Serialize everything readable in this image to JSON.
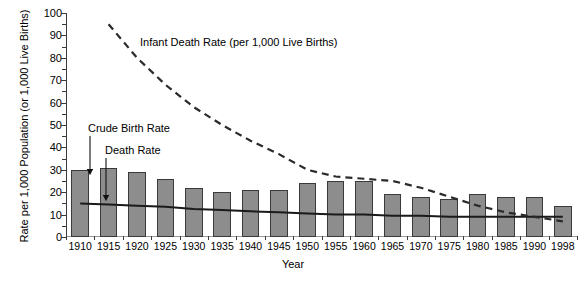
{
  "chart_data": {
    "type": "bar",
    "title": "",
    "xlabel": "Year",
    "ylabel": "Rate per 1,000 Population (or 1,000 Live Births)",
    "ylim": [
      0,
      100
    ],
    "ytick_step": 10,
    "yticks": [
      0,
      10,
      20,
      30,
      40,
      50,
      60,
      70,
      80,
      90,
      100
    ],
    "minor_tick_step": 5,
    "grid": false,
    "legend_position": "none",
    "categories": [
      "1910",
      "1915",
      "1920",
      "1925",
      "1930",
      "1935",
      "1940",
      "1945",
      "1950",
      "1955",
      "1960",
      "1965",
      "1970",
      "1975",
      "1980",
      "1985",
      "1990",
      "1998"
    ],
    "series": [
      {
        "name": "Crude Birth Rate",
        "render": "bar",
        "color": "#8d8d8d",
        "edge_color": "#3a3a3a",
        "values": [
          30,
          31,
          29,
          26,
          22,
          20,
          21,
          21,
          24,
          25,
          25,
          19,
          18,
          17,
          19,
          18,
          18,
          14
        ]
      },
      {
        "name": "Death Rate",
        "render": "solid-line",
        "color": "#1a1a1a",
        "values": [
          15,
          14.5,
          14,
          13.5,
          12.5,
          12,
          11.5,
          11,
          10.5,
          10,
          10,
          9.5,
          9.5,
          9,
          9,
          9,
          9,
          9
        ]
      },
      {
        "name": "Infant Death Rate (per 1,000 Live Births)",
        "render": "dashed-line",
        "color": "#2a2a2a",
        "start_category": "1915",
        "values": [
          null,
          95,
          80,
          68,
          58,
          50,
          43,
          37,
          30,
          27,
          26,
          25,
          22,
          18,
          14,
          11,
          9,
          7
        ]
      }
    ],
    "annotations": [
      {
        "name": "infant-death-rate",
        "text": "Infant Death Rate (per 1,000 Live Births)"
      },
      {
        "name": "crude-birth-rate",
        "text": "Crude Birth Rate"
      },
      {
        "name": "death-rate",
        "text": "Death Rate"
      }
    ]
  }
}
